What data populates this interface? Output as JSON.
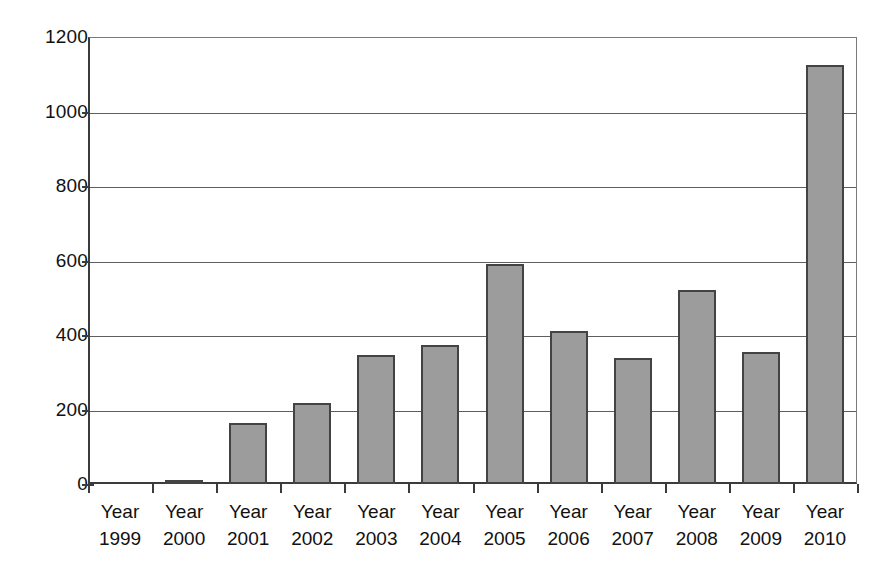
{
  "chart_data": {
    "type": "bar",
    "title": "",
    "subtitle": "",
    "xlabel": "",
    "ylabel": "",
    "categories": [
      "Year 1999",
      "Year 2000",
      "Year 2001",
      "Year 2002",
      "Year 2003",
      "Year 2004",
      "Year 2005",
      "Year 2006",
      "Year 2007",
      "Year 2008",
      "Year 2009",
      "Year 2010"
    ],
    "category_lines": [
      {
        "line1": "Year",
        "line2": "1999"
      },
      {
        "line1": "Year",
        "line2": "2000"
      },
      {
        "line1": "Year",
        "line2": "2001"
      },
      {
        "line1": "Year",
        "line2": "2002"
      },
      {
        "line1": "Year",
        "line2": "2003"
      },
      {
        "line1": "Year",
        "line2": "2004"
      },
      {
        "line1": "Year",
        "line2": "2005"
      },
      {
        "line1": "Year",
        "line2": "2006"
      },
      {
        "line1": "Year",
        "line2": "2007"
      },
      {
        "line1": "Year",
        "line2": "2008"
      },
      {
        "line1": "Year",
        "line2": "2009"
      },
      {
        "line1": "Year",
        "line2": "2010"
      }
    ],
    "values": [
      0,
      12,
      165,
      218,
      347,
      374,
      590,
      411,
      337,
      521,
      354,
      1124
    ],
    "ylim": [
      0,
      1200
    ],
    "yticks": [
      0,
      200,
      400,
      600,
      800,
      1000,
      1200
    ],
    "ytick_labels": [
      "0",
      "200",
      "400",
      "600",
      "800",
      "1000",
      "1200"
    ],
    "grid": true,
    "grid_axis": "y",
    "legend": false,
    "legend_position": "none",
    "series": [
      {
        "name": "",
        "values": [
          0,
          12,
          165,
          218,
          347,
          374,
          590,
          411,
          337,
          521,
          354,
          1124
        ]
      }
    ],
    "colors": {
      "bar_fill": "#9c9c9c",
      "bar_border": "#434343",
      "axis": "#3b3b3b",
      "gridline": "#5e5e5e",
      "background": "#ffffff",
      "text": "#111111"
    }
  }
}
